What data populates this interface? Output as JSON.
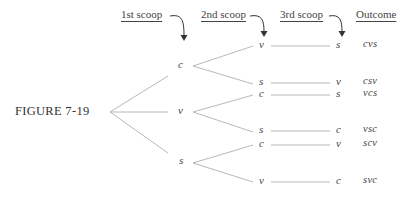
{
  "figure_label": "FIGURE 7-19",
  "headers": {
    "first": "1st scoop",
    "second": "2nd scoop",
    "third": "3rd scoop",
    "outcome": "Outcome"
  },
  "level1": [
    "c",
    "v",
    "s"
  ],
  "level2": [
    "v",
    "s",
    "c",
    "s",
    "c",
    "v"
  ],
  "level3": [
    "s",
    "v",
    "s",
    "c",
    "v",
    "c"
  ],
  "outcomes": [
    "cvs",
    "csv",
    "vcs",
    "vsc",
    "scv",
    "svc"
  ],
  "colors": {
    "line": "#b8b8b8",
    "text": "#444444",
    "arrow": "#333333"
  }
}
